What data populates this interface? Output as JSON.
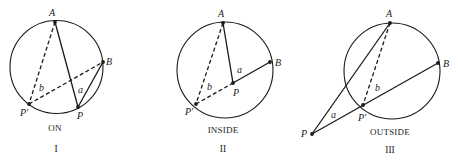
{
  "figure": {
    "colors": {
      "ink": "#1a1a1a",
      "background": "#ffffff"
    },
    "panels": [
      {
        "id": "on",
        "caption": "ON",
        "numeral": "I",
        "circle": {
          "cx": 56.5,
          "cy": 67,
          "r": 46.5
        },
        "points": {
          "A": {
            "label": "A",
            "x": 55,
            "y": 22
          },
          "B": {
            "label": "B",
            "x": 103,
            "y": 62
          },
          "P": {
            "label": "P",
            "x": 78,
            "y": 107
          },
          "Pp": {
            "label": "P′",
            "x": 29,
            "y": 104
          }
        },
        "segment_labels": {
          "a": "a",
          "b": "b"
        }
      },
      {
        "id": "inside",
        "caption": "INSIDE",
        "numeral": "II",
        "circle": {
          "cx": 225,
          "cy": 70,
          "r": 48
        },
        "points": {
          "A": {
            "label": "A",
            "x": 223,
            "y": 23
          },
          "B": {
            "label": "B",
            "x": 270,
            "y": 62
          },
          "P": {
            "label": "P",
            "x": 233,
            "y": 83
          },
          "Pp": {
            "label": "P′",
            "x": 196,
            "y": 104
          }
        },
        "segment_labels": {
          "a": "a",
          "b": "b"
        }
      },
      {
        "id": "outside",
        "caption": "OUTSIDE",
        "numeral": "III",
        "circle": {
          "cx": 392,
          "cy": 71,
          "r": 48
        },
        "points": {
          "A": {
            "label": "A",
            "x": 390,
            "y": 23
          },
          "B": {
            "label": "B",
            "x": 438,
            "y": 63
          },
          "P": {
            "label": "P",
            "x": 312,
            "y": 134
          },
          "Pp": {
            "label": "P′",
            "x": 363,
            "y": 105
          }
        },
        "segment_labels": {
          "a": "a",
          "b": "b"
        }
      }
    ]
  }
}
